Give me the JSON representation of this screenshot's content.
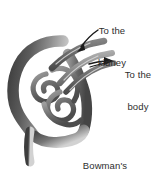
{
  "figure": {
    "background_color": "#ffffff",
    "width": 159,
    "height": 181
  },
  "labels": {
    "kidney": {
      "line1": "To the",
      "line2": "kidney"
    },
    "body": {
      "line1": "To the",
      "line2": "body"
    },
    "capsule": {
      "line1": "Bowman's",
      "line2": "capsule"
    }
  },
  "annotations": {
    "arrow_to_kidney": "arrow-to-kidney",
    "arrow_to_body": "arrow-to-body"
  },
  "colors": {
    "ink": "#2e2e2e",
    "capsule_dark": "#4f4f4f",
    "capsule_mid": "#6e6e6e",
    "capsule_light": "#a8a8a8",
    "vessel_dark": "#5a5a5a",
    "vessel_light": "#b3b3b3",
    "arrow": "#1a1a1a"
  },
  "structures": [
    {
      "name": "bowmans-capsule-wall"
    },
    {
      "name": "glomerulus-capillary-coil"
    },
    {
      "name": "afferent-arteriole"
    },
    {
      "name": "efferent-arteriole"
    },
    {
      "name": "renal-tubule-outlet"
    }
  ]
}
